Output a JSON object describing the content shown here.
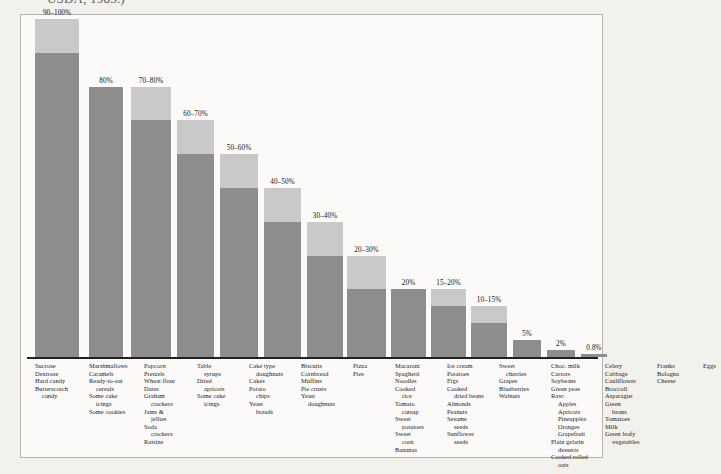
{
  "caption": {
    "text": "USDA, 1985.)"
  },
  "chart_data": {
    "type": "bar",
    "title": "",
    "subtitle": "",
    "xlabel": "",
    "ylabel": "",
    "ylim": [
      0,
      100
    ],
    "grid": false,
    "legend_position": "none",
    "note": "Two-tone stacked bars: the darker lower segment marks the low end of each percentage range, the lighter upper segment extends to the high end of the range.",
    "colors": {
      "range_low_segment": "#8d8d8d",
      "range_high_segment": "#c9c9c9",
      "axis": "#222222",
      "panel_background": "#fbfaf8",
      "page_background": "#f3f1ec",
      "panel_border": "#b9b6b0"
    },
    "categories": [
      "Sucrose group",
      "Marshmallows group",
      "Popcorn group",
      "Table syrups group",
      "Cake type doughnuts group",
      "Biscuits group",
      "Pizza group",
      "Macaroni group",
      "Ice cream group",
      "Sweet cherries group",
      "Choc. milk group",
      "Celery group",
      "Franks group",
      "Eggs group"
    ],
    "labels": [
      "90–100%",
      "80%",
      "70–80%",
      "60–70%",
      "50–60%",
      "40–50%",
      "30–40%",
      "20–30%",
      "20%",
      "15–20%",
      "10–15%",
      "5%",
      "2%",
      "0.8%"
    ],
    "range_low": [
      90,
      80,
      70,
      60,
      50,
      40,
      30,
      20,
      20,
      15,
      10,
      5,
      2,
      0.8
    ],
    "range_high": [
      100,
      80,
      80,
      70,
      60,
      50,
      40,
      30,
      20,
      20,
      15,
      5,
      2,
      0.8
    ],
    "bars": [
      {
        "label": "90–100%",
        "low": 90,
        "high": 100,
        "x": 8,
        "width": 44
      },
      {
        "label": "80%",
        "low": 80,
        "high": 80,
        "x": 62,
        "width": 34
      },
      {
        "label": "70–80%",
        "low": 70,
        "high": 80,
        "x": 104,
        "width": 40
      },
      {
        "label": "60–70%",
        "low": 60,
        "high": 70,
        "x": 150,
        "width": 37
      },
      {
        "label": "50–60%",
        "low": 50,
        "high": 60,
        "x": 193,
        "width": 38
      },
      {
        "label": "40–50%",
        "low": 40,
        "high": 50,
        "x": 237,
        "width": 37
      },
      {
        "label": "30–40%",
        "low": 30,
        "high": 40,
        "x": 280,
        "width": 36
      },
      {
        "label": "20–30%",
        "low": 20,
        "high": 30,
        "x": 320,
        "width": 39
      },
      {
        "label": "20%",
        "low": 20,
        "high": 20,
        "x": 364,
        "width": 35
      },
      {
        "label": "15–20%",
        "low": 15,
        "high": 20,
        "x": 404,
        "width": 35
      },
      {
        "label": "10–15%",
        "low": 10,
        "high": 15,
        "x": 444,
        "width": 36
      },
      {
        "label": "5%",
        "low": 5,
        "high": 5,
        "x": 486,
        "width": 28
      },
      {
        "label": "2%",
        "low": 2,
        "high": 2,
        "x": 520,
        "width": 28
      },
      {
        "label": "0.8%",
        "low": 0.8,
        "high": 0.8,
        "x": 554,
        "width": 26
      }
    ]
  },
  "category_columns": [
    {
      "x": 8,
      "width": 52,
      "items": [
        {
          "text": "Sucrose",
          "indent": false
        },
        {
          "text": "Dextrose",
          "indent": false
        },
        {
          "text": "Hard candy",
          "indent": false
        },
        {
          "text": "Butterscotch",
          "indent": false
        },
        {
          "text": "candy",
          "indent": true
        }
      ]
    },
    {
      "x": 62,
      "width": 52,
      "items": [
        {
          "text": "Marshmallows",
          "indent": false
        },
        {
          "text": "Caramels",
          "indent": false
        },
        {
          "text": "Ready-to-eat",
          "indent": false
        },
        {
          "text": "cereals",
          "indent": true
        },
        {
          "text": "Some cake",
          "indent": false
        },
        {
          "text": "icings",
          "indent": true
        },
        {
          "text": "Some cookies",
          "indent": false
        }
      ]
    },
    {
      "x": 117,
      "width": 48,
      "items": [
        {
          "text": "Popcorn",
          "indent": false
        },
        {
          "text": "Pretzels",
          "indent": false
        },
        {
          "text": "Wheat flour",
          "indent": false
        },
        {
          "text": "Dates",
          "indent": false
        },
        {
          "text": "Graham",
          "indent": false
        },
        {
          "text": "crackers",
          "indent": true
        },
        {
          "text": "Jams &",
          "indent": false
        },
        {
          "text": "jellies",
          "indent": true
        },
        {
          "text": "Soda",
          "indent": false
        },
        {
          "text": "crackers",
          "indent": true
        },
        {
          "text": "Raisins",
          "indent": false
        }
      ]
    },
    {
      "x": 170,
      "width": 48,
      "items": [
        {
          "text": "Table",
          "indent": false
        },
        {
          "text": "syrups",
          "indent": true
        },
        {
          "text": "Dried",
          "indent": false
        },
        {
          "text": "apricots",
          "indent": true
        },
        {
          "text": "Some cake",
          "indent": false
        },
        {
          "text": "icings",
          "indent": true
        }
      ]
    },
    {
      "x": 222,
      "width": 48,
      "items": [
        {
          "text": "Cake type",
          "indent": false
        },
        {
          "text": "doughnuts",
          "indent": true
        },
        {
          "text": "Cakes",
          "indent": false
        },
        {
          "text": "Potato",
          "indent": false
        },
        {
          "text": "chips",
          "indent": true
        },
        {
          "text": "Yeast",
          "indent": false
        },
        {
          "text": "breads",
          "indent": true
        }
      ]
    },
    {
      "x": 274,
      "width": 48,
      "items": [
        {
          "text": "Biscuits",
          "indent": false
        },
        {
          "text": "Cornbread",
          "indent": false
        },
        {
          "text": "Muffins",
          "indent": false
        },
        {
          "text": "Pie crusts",
          "indent": false
        },
        {
          "text": "Yeast",
          "indent": false
        },
        {
          "text": "doughnuts",
          "indent": true
        }
      ]
    },
    {
      "x": 326,
      "width": 40,
      "items": [
        {
          "text": "Pizza",
          "indent": false
        },
        {
          "text": "Pies",
          "indent": false
        }
      ]
    },
    {
      "x": 368,
      "width": 48,
      "items": [
        {
          "text": "Macaroni",
          "indent": false
        },
        {
          "text": "Spaghetti",
          "indent": false
        },
        {
          "text": "Noodles",
          "indent": false
        },
        {
          "text": "Cooked",
          "indent": false
        },
        {
          "text": "rice",
          "indent": true
        },
        {
          "text": "Tomato",
          "indent": false
        },
        {
          "text": "catsup",
          "indent": true
        },
        {
          "text": "Sweet",
          "indent": false
        },
        {
          "text": "potatoes",
          "indent": true
        },
        {
          "text": "Sweet",
          "indent": false
        },
        {
          "text": "corn",
          "indent": true
        },
        {
          "text": "Bananas",
          "indent": false
        }
      ]
    },
    {
      "x": 420,
      "width": 48,
      "items": [
        {
          "text": "Ice cream",
          "indent": false
        },
        {
          "text": "Potatoes",
          "indent": false
        },
        {
          "text": "Figs",
          "indent": false
        },
        {
          "text": "Cooked",
          "indent": false
        },
        {
          "text": "dried beans",
          "indent": true
        },
        {
          "text": "Almonds",
          "indent": false
        },
        {
          "text": "Peanuts",
          "indent": false
        },
        {
          "text": "Sesame",
          "indent": false
        },
        {
          "text": "seeds",
          "indent": true
        },
        {
          "text": "Sunflower",
          "indent": false
        },
        {
          "text": "seeds",
          "indent": true
        }
      ]
    },
    {
      "x": 472,
      "width": 48,
      "items": [
        {
          "text": "Sweet",
          "indent": false
        },
        {
          "text": "cherries",
          "indent": true
        },
        {
          "text": "Grapes",
          "indent": false
        },
        {
          "text": "Blueberries",
          "indent": false
        },
        {
          "text": "Walnuts",
          "indent": false
        }
      ]
    },
    {
      "x": 524,
      "width": 50,
      "items": [
        {
          "text": "Choc. milk",
          "indent": false
        },
        {
          "text": "Carrots",
          "indent": false
        },
        {
          "text": "Soybeans",
          "indent": false
        },
        {
          "text": "Green peas",
          "indent": false
        },
        {
          "text": "Raw:",
          "indent": false
        },
        {
          "text": "Apples",
          "indent": true
        },
        {
          "text": "Apricots",
          "indent": true
        },
        {
          "text": "Pineapples",
          "indent": true
        },
        {
          "text": "Oranges",
          "indent": true
        },
        {
          "text": "Grapefruit",
          "indent": true
        },
        {
          "text": "Plain gelatin",
          "indent": false
        },
        {
          "text": "desserts",
          "indent": true
        },
        {
          "text": "Cooked rolled",
          "indent": false
        },
        {
          "text": "oats",
          "indent": true
        }
      ]
    },
    {
      "x": 578,
      "width": 48,
      "items": [
        {
          "text": "Celery",
          "indent": false
        },
        {
          "text": "Cabbage",
          "indent": false
        },
        {
          "text": "Cauliflower",
          "indent": false
        },
        {
          "text": "Broccoli",
          "indent": false
        },
        {
          "text": "Asparagus",
          "indent": false
        },
        {
          "text": "Green",
          "indent": false
        },
        {
          "text": "beans",
          "indent": true
        },
        {
          "text": "Tomatoes",
          "indent": false
        },
        {
          "text": "Milk",
          "indent": false
        },
        {
          "text": "Green leafy",
          "indent": false
        },
        {
          "text": "vegetables",
          "indent": true
        }
      ]
    },
    {
      "x": 630,
      "width": 42,
      "items": [
        {
          "text": "Franks",
          "indent": false
        },
        {
          "text": "Bologna",
          "indent": false
        },
        {
          "text": "Cheese",
          "indent": false
        }
      ]
    },
    {
      "x": 676,
      "width": 36,
      "items": [
        {
          "text": "Eggs",
          "indent": false
        }
      ]
    }
  ]
}
